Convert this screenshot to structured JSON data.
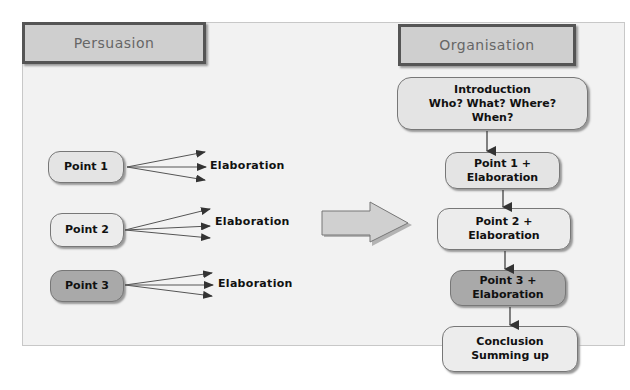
{
  "persuasion": {
    "title": "Persuasion",
    "points": [
      {
        "label": "Point 1",
        "elaboration": "Elaboration",
        "shade": "light"
      },
      {
        "label": "Point 2",
        "elaboration": "Elaboration",
        "shade": "lighter"
      },
      {
        "label": "Point 3",
        "elaboration": "Elaboration",
        "shade": "dark"
      }
    ]
  },
  "organisation": {
    "title": "Organisation",
    "steps": [
      {
        "label": "Introduction\nWho? What? Where?\nWhen?"
      },
      {
        "label": "Point 1 +\nElaboration"
      },
      {
        "label": "Point 2 +\nElaboration"
      },
      {
        "label": "Point 3 +\nElaboration"
      },
      {
        "label": "Conclusion\nSumming up"
      }
    ]
  },
  "colors": {
    "panel_bg": "#f2f2f2",
    "header_bg": "#cfcfcf",
    "node_light": "#e4e4e4",
    "node_dark": "#a9a9a9",
    "border": "#555555"
  }
}
